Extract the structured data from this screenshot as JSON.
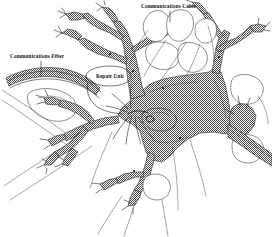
{
  "figure": {
    "kind": "technical-line-drawing",
    "background_color": "#ffffff",
    "ink_color": "#2b2b2b",
    "fill_texture": "cross-hatch stipple gray",
    "fill_tone": "#7d7d7d",
    "width": 272,
    "height": 237
  },
  "annotations": {
    "communications_cable": {
      "label": "Communications Cable",
      "position": "top-center",
      "leader": "vertical line descending from label to upper white lobed bodies"
    },
    "communications_fiber": {
      "label": "Communications Fiber",
      "position": "upper-left",
      "leader": "vertical line descending from label to the left fiber band"
    },
    "repair_unit": {
      "label": "Repair Unit",
      "position": "center-left of cell body",
      "leader": "oval callout with line descending to the central cluster"
    }
  }
}
